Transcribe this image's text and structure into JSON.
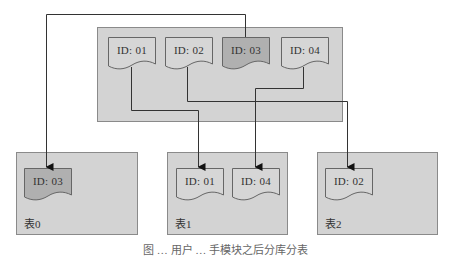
{
  "diagram": {
    "source": {
      "docs": [
        {
          "label": "ID: 01",
          "highlighted": false
        },
        {
          "label": "ID: 02",
          "highlighted": false
        },
        {
          "label": "ID: 03",
          "highlighted": true
        },
        {
          "label": "ID: 04",
          "highlighted": false
        }
      ]
    },
    "tables": [
      {
        "name": "表0",
        "docs": [
          {
            "label": "ID: 03",
            "highlighted": true
          }
        ]
      },
      {
        "name": "表1",
        "docs": [
          {
            "label": "ID: 01",
            "highlighted": false
          },
          {
            "label": "ID: 04",
            "highlighted": false
          }
        ]
      },
      {
        "name": "表2",
        "docs": [
          {
            "label": "ID: 02",
            "highlighted": false
          }
        ]
      }
    ],
    "edges": [
      {
        "from": "ID: 01",
        "to": "表1"
      },
      {
        "from": "ID: 02",
        "to": "表2"
      },
      {
        "from": "ID: 03",
        "to": "表0"
      },
      {
        "from": "ID: 04",
        "to": "表1"
      }
    ],
    "caption": "图 … 用户 … 手模块之后分库分表"
  },
  "colors": {
    "container": "#d3d3d3",
    "doc": "#d6d6d6",
    "doc_highlight": "#b0b0b0",
    "border": "#8a8a8a",
    "line": "#333333"
  }
}
